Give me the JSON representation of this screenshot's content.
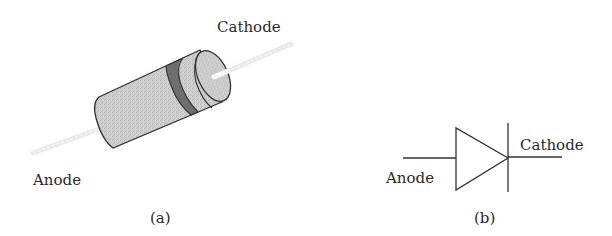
{
  "panel_a": {
    "caption": "(a)",
    "cathode_label": "Cathode",
    "anode_label": "Anode",
    "component": "diode-physical-package",
    "colors": {
      "body": "#c8c8c8",
      "band": "#6e6e6e",
      "outline": "#333333",
      "lead": "#ececec"
    }
  },
  "panel_b": {
    "caption": "(b)",
    "cathode_label": "Cathode",
    "anode_label": "Anode",
    "component": "diode-schematic-symbol",
    "colors": {
      "stroke": "#333333"
    }
  }
}
